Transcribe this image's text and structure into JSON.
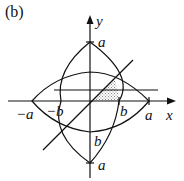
{
  "figure": {
    "panel_label": "(b)",
    "axis_labels": {
      "x": "x",
      "y": "y"
    },
    "tick_labels": {
      "x_neg_a": "−a",
      "x_neg_b": "−b",
      "x_pos_b": "b",
      "x_pos_a": "a",
      "y_pos_a": "a",
      "y_neg_b": "b",
      "y_neg_a": "a"
    },
    "colors": {
      "stroke": "#111111",
      "shade": "#bbbbbb"
    }
  }
}
